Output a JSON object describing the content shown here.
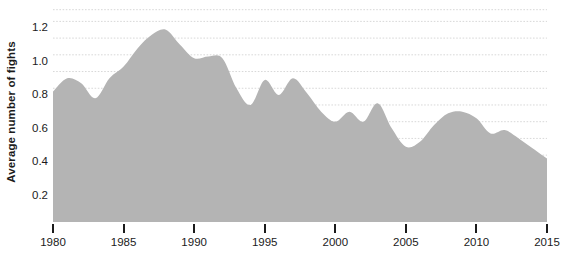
{
  "chart_data": {
    "type": "area",
    "title": "",
    "subtitle": "",
    "xlabel": "",
    "ylabel": "Average number of fights",
    "xlim": [
      1980,
      2015
    ],
    "ylim": [
      0,
      1.28
    ],
    "grid": true,
    "legend": null,
    "fill_color": "#b4b4b4",
    "grid_color": "#d8d8d8",
    "text_color": "#1b1b1b",
    "background_color": "#ffffff",
    "x_ticks": [
      1980,
      1985,
      1990,
      1995,
      2000,
      2005,
      2010,
      2015
    ],
    "x_tick_labels": [
      "1980",
      "1985",
      "1990",
      "1995",
      "2000",
      "2005",
      "2010",
      "2015"
    ],
    "y_ticks": [
      0.2,
      0.4,
      0.6,
      0.8,
      1.0,
      1.2
    ],
    "y_tick_labels": [
      "0.2",
      "0.4",
      "0.6",
      "0.8",
      "1.0",
      "1.2"
    ],
    "minor_gridlines": [
      0.3,
      0.5,
      0.7,
      0.9,
      1.1,
      1.27
    ],
    "x": [
      1980,
      1981,
      1982,
      1983,
      1984,
      1985,
      1986,
      1987,
      1988,
      1989,
      1990,
      1991,
      1992,
      1993,
      1994,
      1995,
      1996,
      1997,
      1998,
      1999,
      2000,
      2001,
      2002,
      2003,
      2004,
      2005,
      2006,
      2007,
      2008,
      2009,
      2010,
      2011,
      2012,
      2013,
      2014,
      2015
    ],
    "values": [
      0.78,
      0.86,
      0.83,
      0.74,
      0.86,
      0.93,
      1.04,
      1.12,
      1.15,
      1.06,
      0.98,
      0.99,
      0.98,
      0.8,
      0.7,
      0.85,
      0.76,
      0.86,
      0.77,
      0.66,
      0.6,
      0.66,
      0.6,
      0.71,
      0.56,
      0.45,
      0.48,
      0.58,
      0.65,
      0.66,
      0.62,
      0.53,
      0.55,
      0.5,
      0.44,
      0.38
    ]
  }
}
